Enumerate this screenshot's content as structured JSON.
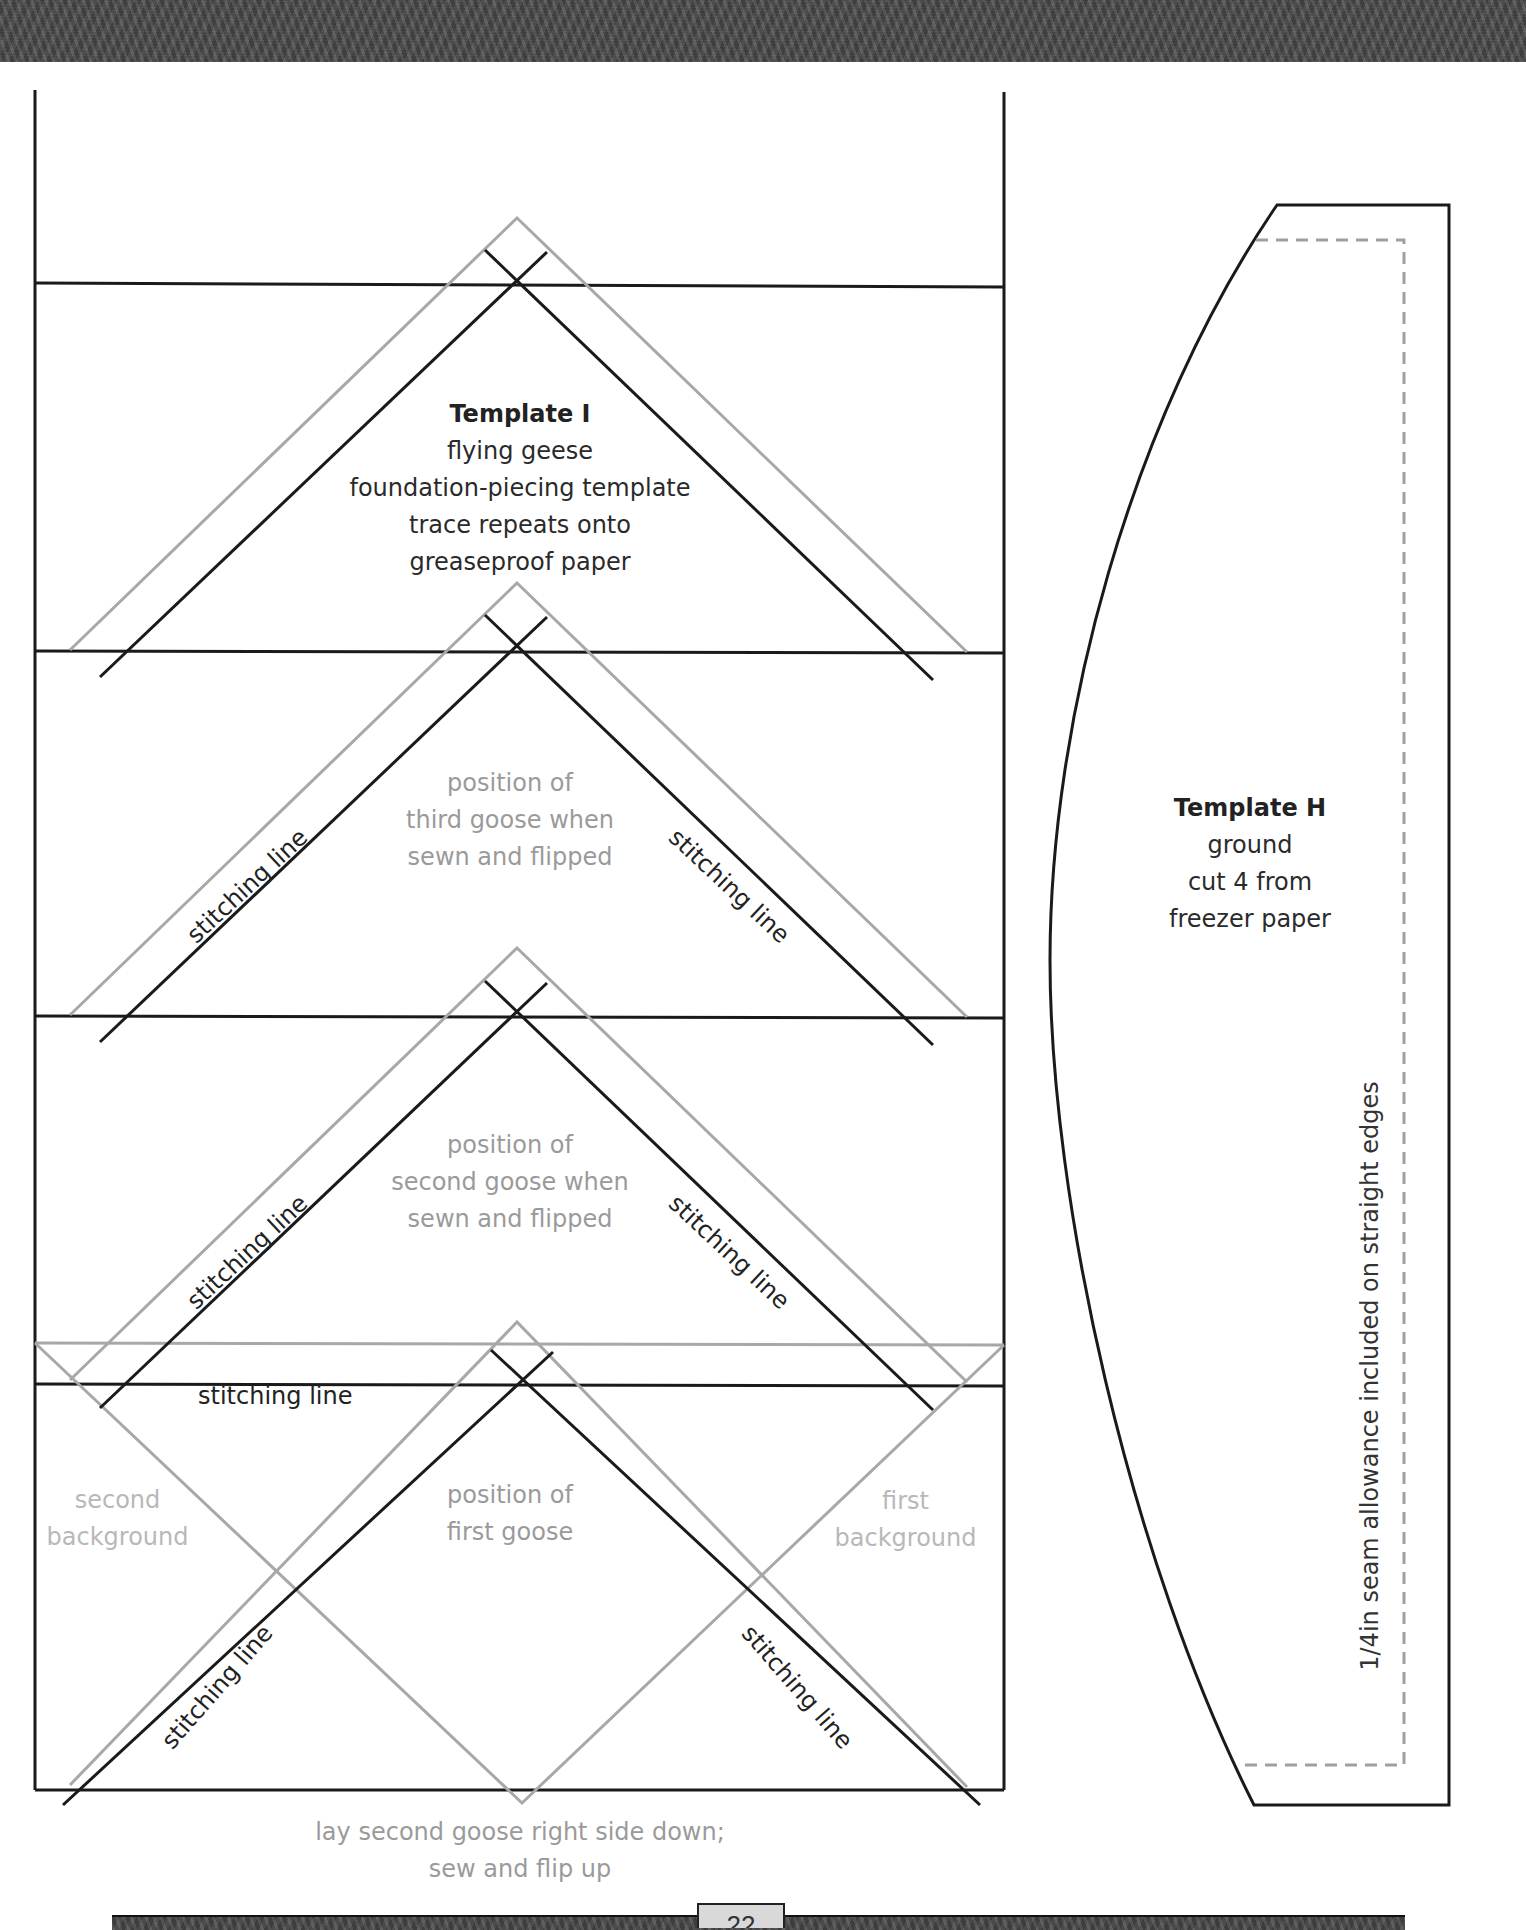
{
  "page": {
    "page_number_partial": "22",
    "colors": {
      "black_line": "#1a1a1a",
      "grey_line": "#a8a8a8",
      "dashed": "#a0a0a0",
      "band": "#4a4a4a"
    }
  },
  "template_i": {
    "title": "Template I",
    "lines": [
      "flying geese",
      "foundation-piecing template",
      "trace repeats onto",
      "greaseproof paper"
    ],
    "third_goose": [
      "position of",
      "third goose when",
      "sewn and flipped"
    ],
    "second_goose": [
      "position of",
      "second goose when",
      "sewn and flipped"
    ],
    "first_goose": [
      "position of",
      "first goose"
    ],
    "second_background": [
      "second",
      "background"
    ],
    "first_background": [
      "first",
      "background"
    ],
    "stitching_label": "stitching line",
    "caption": [
      "lay second goose right side down;",
      "sew and flip up"
    ]
  },
  "template_h": {
    "title": "Template H",
    "lines": [
      "ground",
      "cut 4 from",
      "freezer paper"
    ],
    "seam_note": "1/4in seam allowance included on straight edges"
  }
}
